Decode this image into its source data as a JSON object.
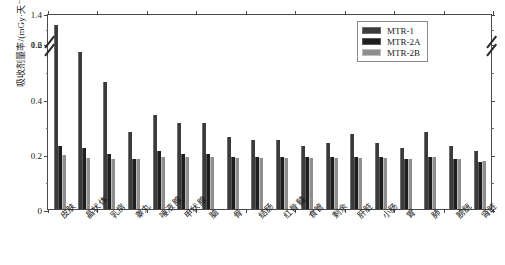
{
  "chart_data": {
    "type": "bar",
    "title": "",
    "xlabel": "",
    "ylabel": "吸收剂量率/(mGy·天⁻¹)",
    "ylim": [
      0,
      1.4
    ],
    "y_axis_break": {
      "lower_max": 0.6,
      "upper_min": 1.2
    },
    "yticks": [
      "0",
      "0.2",
      "0.4",
      "0.6",
      "1.2",
      "1.4"
    ],
    "grid": false,
    "legend_position": "upper right",
    "categories": [
      "皮肤",
      "晶状体",
      "乳房",
      "睾丸",
      "唾液腺",
      "甲状腺",
      "脑",
      "骨",
      "结肠",
      "红骨髓",
      "食管",
      "剩余",
      "肝脏",
      "小肠",
      "胃",
      "肺",
      "膀胱",
      "肾脏"
    ],
    "series": [
      {
        "name": "MTR-1",
        "color": "#3b3b3b",
        "values": [
          1.32,
          0.57,
          0.46,
          0.28,
          0.34,
          0.31,
          0.31,
          0.26,
          0.25,
          0.25,
          0.23,
          0.24,
          0.27,
          0.24,
          0.22,
          0.28,
          0.23,
          0.21
        ]
      },
      {
        "name": "MTR-2A",
        "color": "#1e1e1e",
        "values": [
          0.23,
          0.22,
          0.2,
          0.18,
          0.21,
          0.2,
          0.2,
          0.19,
          0.19,
          0.19,
          0.19,
          0.19,
          0.19,
          0.19,
          0.18,
          0.19,
          0.18,
          0.17
        ]
      },
      {
        "name": "MTR-2B",
        "color": "#8e8e8e",
        "values": [
          0.195,
          0.185,
          0.18,
          0.18,
          0.19,
          0.19,
          0.19,
          0.185,
          0.185,
          0.185,
          0.185,
          0.185,
          0.185,
          0.185,
          0.18,
          0.19,
          0.18,
          0.175
        ]
      }
    ]
  },
  "legend": {
    "entries": [
      {
        "label": "MTR-1"
      },
      {
        "label": "MTR-2A"
      },
      {
        "label": "MTR-2B"
      }
    ]
  },
  "axes": {
    "y_title": "吸收剂量率/(mGy·天⁻¹)",
    "y_tick_labels": [
      "0",
      "0.2",
      "0.4",
      "0.6",
      "1.2",
      "1.4"
    ]
  }
}
